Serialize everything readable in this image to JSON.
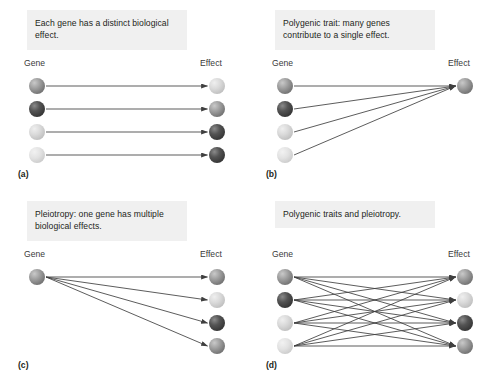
{
  "figure": {
    "background": "#ffffff",
    "caption_bg": "#f0f0f0",
    "line_color": "#3f3f3f"
  },
  "tones": {
    "medium": "#8b8b8b",
    "dark": "#3b3b3b",
    "light": "#d4d4d4",
    "pale": "#e0e0e0"
  },
  "panels": [
    {
      "id": "a",
      "label": "(a)",
      "caption": "Each gene has a distinct biological effect.",
      "left_header": "Gene",
      "right_header": "Effect",
      "genes": [
        {
          "index": 0,
          "tone": "medium"
        },
        {
          "index": 1,
          "tone": "dark"
        },
        {
          "index": 2,
          "tone": "light"
        },
        {
          "index": 3,
          "tone": "pale"
        }
      ],
      "effects": [
        {
          "index": 0,
          "tone": "light"
        },
        {
          "index": 1,
          "tone": "medium"
        },
        {
          "index": 2,
          "tone": "dark"
        },
        {
          "index": 3,
          "tone": "dark"
        }
      ],
      "edges": [
        [
          0,
          0
        ],
        [
          1,
          1
        ],
        [
          2,
          2
        ],
        [
          3,
          3
        ]
      ]
    },
    {
      "id": "b",
      "label": "(b)",
      "caption": "Polygenic trait: many genes contribute to a single effect.",
      "left_header": "Gene",
      "right_header": "Effect",
      "genes": [
        {
          "index": 0,
          "tone": "medium"
        },
        {
          "index": 1,
          "tone": "dark"
        },
        {
          "index": 2,
          "tone": "light"
        },
        {
          "index": 3,
          "tone": "pale"
        }
      ],
      "effects": [
        {
          "index": 0,
          "tone": "medium"
        }
      ],
      "edges": [
        [
          0,
          0
        ],
        [
          1,
          0
        ],
        [
          2,
          0
        ],
        [
          3,
          0
        ]
      ]
    },
    {
      "id": "c",
      "label": "(c)",
      "caption": "Pleiotropy: one gene has multiple biological effects.",
      "left_header": "Gene",
      "right_header": "Effect",
      "genes": [
        {
          "index": 0,
          "tone": "medium"
        }
      ],
      "effects": [
        {
          "index": 0,
          "tone": "medium"
        },
        {
          "index": 1,
          "tone": "light"
        },
        {
          "index": 2,
          "tone": "dark"
        },
        {
          "index": 3,
          "tone": "medium"
        }
      ],
      "edges": [
        [
          0,
          0
        ],
        [
          0,
          1
        ],
        [
          0,
          2
        ],
        [
          0,
          3
        ]
      ]
    },
    {
      "id": "d",
      "label": "(d)",
      "caption": "Polygenic traits and pleiotropy.",
      "left_header": "Gene",
      "right_header": "Effect",
      "genes": [
        {
          "index": 0,
          "tone": "medium"
        },
        {
          "index": 1,
          "tone": "dark"
        },
        {
          "index": 2,
          "tone": "light"
        },
        {
          "index": 3,
          "tone": "pale"
        }
      ],
      "effects": [
        {
          "index": 0,
          "tone": "medium"
        },
        {
          "index": 1,
          "tone": "light"
        },
        {
          "index": 2,
          "tone": "dark"
        },
        {
          "index": 3,
          "tone": "medium"
        }
      ],
      "edges": [
        [
          0,
          0
        ],
        [
          0,
          1
        ],
        [
          0,
          2
        ],
        [
          0,
          3
        ],
        [
          1,
          0
        ],
        [
          1,
          1
        ],
        [
          1,
          2
        ],
        [
          1,
          3
        ],
        [
          2,
          0
        ],
        [
          2,
          1
        ],
        [
          2,
          2
        ],
        [
          2,
          3
        ],
        [
          3,
          0
        ],
        [
          3,
          1
        ],
        [
          3,
          2
        ],
        [
          3,
          3
        ]
      ]
    }
  ],
  "geometry": {
    "node_diameter": 16,
    "row_ys": [
      78,
      101,
      124,
      147
    ],
    "gene_x": 29,
    "effect_x": 209,
    "panel_width": 247,
    "panel_height": 191
  }
}
